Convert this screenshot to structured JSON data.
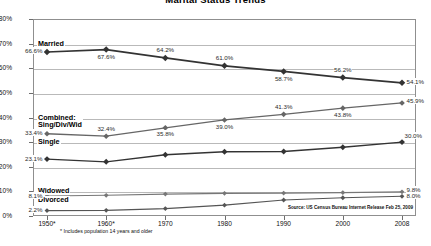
{
  "chart_data": {
    "type": "line",
    "title": "Marital Status Trends",
    "xlabel": "",
    "ylabel": "",
    "ylim": [
      0,
      80
    ],
    "grid": true,
    "legend_position": "inline-labels",
    "categories": [
      "1950*",
      "1960*",
      "1970",
      "1980",
      "1990",
      "2000",
      "2008"
    ],
    "y_ticks": [
      "0%",
      "10%",
      "20%",
      "30%",
      "40%",
      "50%",
      "60%",
      "70%",
      "80%"
    ],
    "series": [
      {
        "name": "Married",
        "values": [
          66.6,
          67.6,
          64.2,
          61.0,
          58.7,
          56.2,
          54.1
        ],
        "labels": [
          "66.6%",
          "67.6%",
          "64.2%",
          "61.0%",
          "58.7%",
          "56.2%",
          "54.1%"
        ]
      },
      {
        "name": "Combined: Sing/Div/Wid",
        "name_line1": "Combined:",
        "name_line2": "Sing/Div/Wid",
        "values": [
          33.4,
          32.4,
          35.8,
          39.0,
          41.3,
          43.8,
          45.9
        ],
        "labels": [
          "33.4%",
          "32.4%",
          "35.8%",
          "39.0%",
          "41.3%",
          "43.8%",
          "45.9%"
        ]
      },
      {
        "name": "Single",
        "values": [
          23.1,
          22.0,
          24.9,
          26.1,
          26.2,
          27.9,
          30.0
        ],
        "labels": [
          "23.1%",
          "",
          "",
          "",
          "",
          "",
          "30.0%"
        ]
      },
      {
        "name": "Widowed",
        "values": [
          8.1,
          8.4,
          8.9,
          9.2,
          9.3,
          9.5,
          9.8
        ],
        "labels": [
          "8.1%",
          "",
          "",
          "",
          "",
          "",
          "9.8%"
        ]
      },
      {
        "name": "Divorced",
        "values": [
          2.2,
          2.3,
          3.0,
          4.4,
          6.5,
          7.4,
          8.0
        ],
        "labels": [
          "2.2%",
          "",
          "",
          "",
          "",
          "",
          "8.0%"
        ]
      }
    ],
    "footnote": "* Includes population 14 years and older",
    "source": "Source: US Census Bureau Internet Release Feb 25, 2009",
    "colors": {
      "married_line": "#333333",
      "combined_line": "#666666",
      "single_line": "#333333",
      "widowed_line": "#777777",
      "divorced_line": "#555555",
      "grid": "#b9b9b9",
      "frame": "#8f8f8f",
      "background": "#ffffff"
    }
  }
}
